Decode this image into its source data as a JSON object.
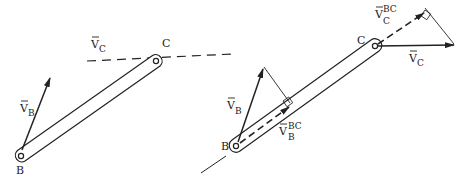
{
  "left_figure": {
    "point_B": "B",
    "point_C": "C",
    "vB_main": "V",
    "vB_sub": "B",
    "vC_main": "V",
    "vC_sub": "C"
  },
  "right_figure": {
    "point_B": "B",
    "point_C": "C",
    "vB_main": "V",
    "vB_sub": "B",
    "vC_main": "V",
    "vC_sub": "C",
    "vBBC_main": "V",
    "vBBC_sup": "BC",
    "vBBC_sub": "B",
    "vCBC_main": "V",
    "vCBC_sup": "BC",
    "vCBC_sub": "C"
  },
  "colors": {
    "ink": "#222222",
    "background": "#ffffff"
  }
}
